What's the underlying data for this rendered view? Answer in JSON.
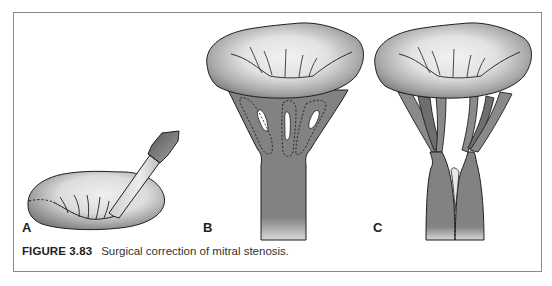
{
  "figure": {
    "number_label": "FIGURE 3.83",
    "caption": "Surgical correction of mitral stenosis."
  },
  "panels": [
    {
      "label": "A",
      "description": "Mitral valve viewed from above with instrument (finger/dilator) splitting fused commissure; dashed line marks commissure"
    },
    {
      "label": "B",
      "description": "Mitral valve with fused chordae tendineae; dashed outlines indicate planned incisions"
    },
    {
      "label": "C",
      "description": "Mitral valve after chordal fenestration and papillary muscle splitting; dashed line at split"
    }
  ],
  "colors": {
    "tissue_dark": "#7e7e7e",
    "tissue_light": "#e6e6e6",
    "outline": "#1f1f1f",
    "frame": "#8a8a8a"
  }
}
